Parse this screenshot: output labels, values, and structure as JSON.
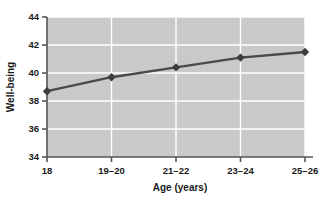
{
  "chart_data": {
    "type": "line",
    "title": "",
    "xlabel": "Age (years)",
    "ylabel": "Well-being",
    "categories": [
      "18",
      "19–20",
      "21–22",
      "23–24",
      "25–26"
    ],
    "values": [
      38.7,
      39.7,
      40.4,
      41.1,
      41.5
    ],
    "series": [
      {
        "name": "Well-being",
        "values": [
          38.7,
          39.7,
          40.4,
          41.1,
          41.5
        ]
      }
    ],
    "ylim": [
      34,
      44
    ],
    "yticks": [
      34,
      36,
      38,
      40,
      42,
      44
    ],
    "ytick_labels": [
      "34",
      "36",
      "38",
      "40",
      "42",
      "44"
    ],
    "grid": true,
    "grid_color": "#ffffff",
    "legend": false,
    "legend_position": "none",
    "plot_background": "#c9c9c9",
    "line_color": "#4a4a4a",
    "marker_color": "#3d3d3d",
    "marker_shape": "diamond",
    "axis_color": "#555555"
  }
}
